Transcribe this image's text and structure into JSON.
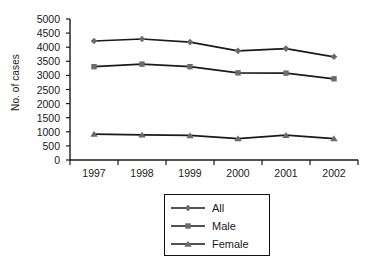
{
  "chart_data": {
    "type": "line",
    "title": "",
    "xlabel": "",
    "ylabel": "No. of cases",
    "categories": [
      "1997",
      "1998",
      "1999",
      "2000",
      "2001",
      "2002"
    ],
    "yticks": [
      5000,
      4500,
      4000,
      3500,
      3000,
      2500,
      2000,
      1500,
      1000,
      500,
      0
    ],
    "ylim": [
      0,
      5000
    ],
    "grid": false,
    "legend_position": "bottom-center",
    "series": [
      {
        "name": "All",
        "marker": "diamond",
        "values": [
          4220,
          4290,
          4180,
          3870,
          3950,
          3660
        ]
      },
      {
        "name": "Male",
        "marker": "square",
        "values": [
          3310,
          3400,
          3310,
          3090,
          3080,
          2880
        ]
      },
      {
        "name": "Female",
        "marker": "triangle",
        "values": [
          920,
          890,
          870,
          760,
          880,
          760
        ]
      }
    ],
    "colors": {
      "line": "#1a1a1a",
      "marker": "#6b6b6b",
      "axis": "#1a1a1a",
      "background": "#ffffff"
    }
  }
}
